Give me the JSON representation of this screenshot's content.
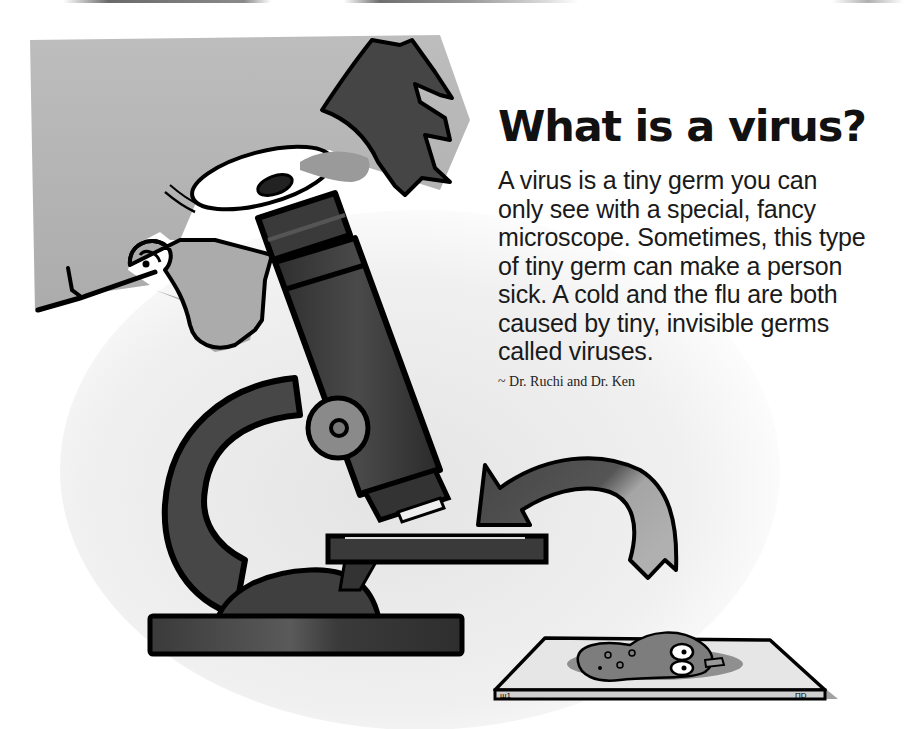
{
  "page": {
    "headline": "What is a virus?",
    "body_lines": [
      "A virus is a tiny germ you can",
      "only see with a special, fancy",
      "microscope. Sometimes, this type",
      "of tiny germ can make a person",
      "sick. A cold and the flu are both",
      "caused by tiny, invisible germs",
      "called viruses."
    ],
    "attribution": "~ Dr. Ruchi and Dr. Ken"
  },
  "illustration": {
    "subject": "cartoon scientist looking through microscope",
    "elements": [
      "scientist-face",
      "microscope",
      "curved-arrow",
      "slide-with-germ"
    ],
    "palette": {
      "background": "#ffffff",
      "skin": "#b8b8b8",
      "hair": "#4a4a4a",
      "microscope": "#3c3c3c",
      "arrow_dark": "#4a4a4a",
      "arrow_light": "#a8a8a8",
      "slide": "#e0e0e0",
      "germ": "#8c8c8c",
      "outline": "#000000"
    }
  }
}
